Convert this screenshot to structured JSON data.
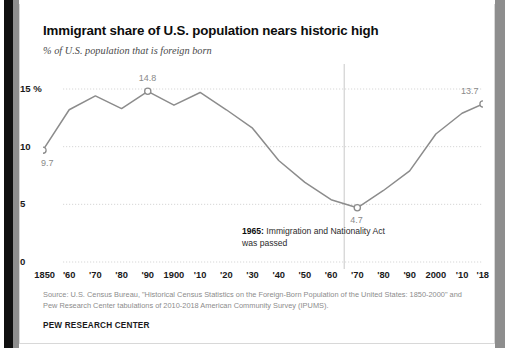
{
  "chart_data": {
    "type": "line",
    "title": "Immigrant share of U.S. population nears historic high",
    "subtitle": "% of U.S. population that is foreign born",
    "xlabel": "",
    "ylabel": "",
    "ylim": [
      0,
      16
    ],
    "xlim": [
      1850,
      2018
    ],
    "grid": true,
    "legend": "none",
    "yticks": [
      {
        "value": 15,
        "label": "15 %"
      },
      {
        "value": 10,
        "label": "10"
      },
      {
        "value": 5,
        "label": "5"
      },
      {
        "value": 0,
        "label": "0"
      }
    ],
    "xticks": [
      {
        "value": 1850,
        "label": "1850"
      },
      {
        "value": 1860,
        "label": "'60"
      },
      {
        "value": 1870,
        "label": "'70"
      },
      {
        "value": 1880,
        "label": "'80"
      },
      {
        "value": 1890,
        "label": "'90"
      },
      {
        "value": 1900,
        "label": "1900"
      },
      {
        "value": 1910,
        "label": "'10"
      },
      {
        "value": 1920,
        "label": "'20"
      },
      {
        "value": 1930,
        "label": "'30"
      },
      {
        "value": 1940,
        "label": "'40"
      },
      {
        "value": 1950,
        "label": "'50"
      },
      {
        "value": 1960,
        "label": "'60"
      },
      {
        "value": 1970,
        "label": "'70"
      },
      {
        "value": 1980,
        "label": "'80"
      },
      {
        "value": 1990,
        "label": "'90"
      },
      {
        "value": 2000,
        "label": "2000"
      },
      {
        "value": 2010,
        "label": "'10"
      },
      {
        "value": 2018,
        "label": "'18"
      }
    ],
    "x": [
      1850,
      1860,
      1870,
      1880,
      1890,
      1900,
      1910,
      1920,
      1930,
      1940,
      1950,
      1960,
      1970,
      1980,
      1990,
      2000,
      2010,
      2018
    ],
    "values": [
      9.7,
      13.2,
      14.4,
      13.3,
      14.8,
      13.6,
      14.7,
      13.2,
      11.6,
      8.8,
      6.9,
      5.4,
      4.7,
      6.2,
      7.9,
      11.1,
      12.9,
      13.7
    ],
    "series": [
      {
        "name": "% of U.S. population that is foreign born",
        "color": "#8c8c8c",
        "values": [
          9.7,
          13.2,
          14.4,
          13.3,
          14.8,
          13.6,
          14.7,
          13.2,
          11.6,
          8.8,
          6.9,
          5.4,
          4.7,
          6.2,
          7.9,
          11.1,
          12.9,
          13.7
        ]
      }
    ],
    "point_labels": [
      {
        "x": 1850,
        "y": 9.7,
        "label": "9.7",
        "marker": true
      },
      {
        "x": 1890,
        "y": 14.8,
        "label": "14.8",
        "marker": true
      },
      {
        "x": 1970,
        "y": 4.7,
        "label": "4.7",
        "marker": true
      },
      {
        "x": 2018,
        "y": 13.7,
        "label": "13.7",
        "marker": true
      }
    ],
    "reference_lines": [
      {
        "x": 1965,
        "orientation": "vertical",
        "color": "#c9c9c9"
      }
    ],
    "annotations": [
      {
        "x": 1965,
        "bold_text": "1965:",
        "text": " Immigration and Nationality Act was passed"
      }
    ]
  },
  "source": {
    "note": "Source: U.S. Census Bureau, \"Historical Census Statistics on the Foreign-Born Population of the United States: 1850-2000\" and Pew Research Center tabulations of 2010-2018 American Community Survey (IPUMS).",
    "org": "PEW RESEARCH CENTER"
  }
}
